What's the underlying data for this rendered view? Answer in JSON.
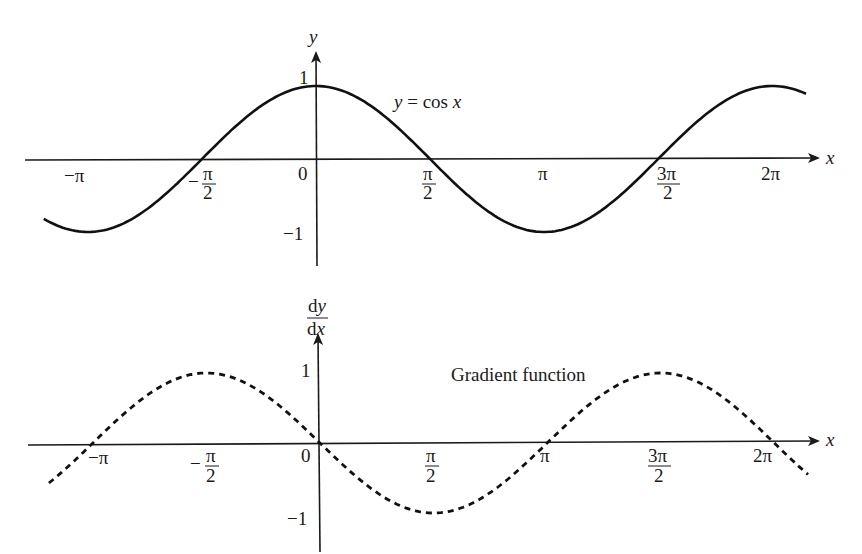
{
  "chart_data": [
    {
      "type": "line",
      "title": "y = cos x",
      "curve_label": "y = cos x",
      "function": "cos(x)",
      "style": "solid",
      "xlabel": "x",
      "ylabel": "y",
      "x_ticks": [
        "−π",
        "−π/2",
        "0",
        "π/2",
        "π",
        "3π/2",
        "2π"
      ],
      "y_ticks": [
        "1",
        "−1"
      ],
      "xlim": [
        -4.1,
        7.0
      ],
      "ylim": [
        -1.3,
        1.4
      ],
      "x": [
        -3.75,
        -3.1416,
        -1.5708,
        0,
        1.5708,
        3.1416,
        4.7124,
        6.2832,
        6.75
      ],
      "y": [
        -0.82,
        -1,
        0,
        1,
        0,
        -1,
        0,
        1,
        0.89
      ],
      "grid": false
    },
    {
      "type": "line",
      "title": "Gradient function",
      "curve_label": "Gradient function",
      "function": "-sin(x)",
      "style": "dashed",
      "xlabel": "x",
      "ylabel": "dy/dx",
      "ylabel_num": "dy",
      "ylabel_den": "dx",
      "x_ticks": [
        "−π",
        "−π/2",
        "0",
        "π/2",
        "π",
        "3π/2",
        "2π"
      ],
      "y_ticks": [
        "1",
        "−1"
      ],
      "xlim": [
        -4.1,
        7.0
      ],
      "ylim": [
        -1.3,
        1.4
      ],
      "x": [
        -3.75,
        -3.1416,
        -1.5708,
        0,
        1.5708,
        3.1416,
        4.7124,
        6.2832,
        6.75
      ],
      "y": [
        -0.57,
        0,
        1,
        0,
        -1,
        0,
        1,
        0,
        -0.45
      ],
      "grid": false
    }
  ],
  "top": {
    "x_axis_label": "x",
    "y_axis_label": "y",
    "curve_label": "y = cos x",
    "tick_labels": {
      "neg_pi": "−π",
      "neg_half_pi_num": "π",
      "neg_half_pi_den": "2",
      "neg_sign": "−",
      "zero": "0",
      "half_pi_num": "π",
      "half_pi_den": "2",
      "pi": "π",
      "three_half_pi_num": "3π",
      "three_half_pi_den": "2",
      "two_pi": "2π",
      "y_one": "1",
      "y_neg_one": "−1"
    }
  },
  "bottom": {
    "x_axis_label": "x",
    "y_axis_label_num": "dy",
    "y_axis_label_den": "dx",
    "curve_label": "Gradient function",
    "tick_labels": {
      "neg_pi": "−π",
      "neg_half_pi_num": "π",
      "neg_half_pi_den": "2",
      "neg_sign": "−",
      "zero": "0",
      "half_pi_num": "π",
      "half_pi_den": "2",
      "pi": "π",
      "three_half_pi_num": "3π",
      "three_half_pi_den": "2",
      "two_pi": "2π",
      "y_one": "1",
      "y_neg_one": "−1"
    }
  }
}
